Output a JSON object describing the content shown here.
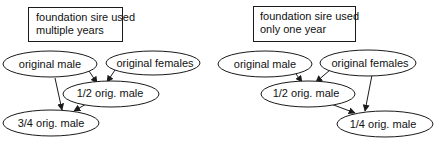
{
  "diagram": {
    "colors": {
      "stroke": "#1a1a1a",
      "text": "#111111",
      "background": "#ffffff"
    },
    "panels": [
      {
        "id": "left",
        "caption_line1": "foundation sire used",
        "caption_line2": "multiple years",
        "nodes": {
          "original_male": "original male",
          "original_females": "original females",
          "half": "1/2 orig. male",
          "result": "3/4 orig. male"
        },
        "edges": [
          {
            "from": "original male",
            "to": "1/2 orig. male"
          },
          {
            "from": "original females",
            "to": "1/2 orig. male"
          },
          {
            "from": "original male",
            "to": "3/4 orig. male"
          },
          {
            "from": "1/2 orig. male",
            "to": "3/4 orig. male"
          }
        ]
      },
      {
        "id": "right",
        "caption_line1": "foundation sire used",
        "caption_line2": "only one year",
        "nodes": {
          "original_male": "original male",
          "original_females": "original females",
          "half": "1/2 orig. male",
          "result": "1/4 orig. male"
        },
        "edges": [
          {
            "from": "original male",
            "to": "1/2 orig. male"
          },
          {
            "from": "original females",
            "to": "1/2 orig. male"
          },
          {
            "from": "original females",
            "to": "1/4 orig. male"
          },
          {
            "from": "1/2 orig. male",
            "to": "1/4 orig. male"
          }
        ]
      }
    ]
  }
}
